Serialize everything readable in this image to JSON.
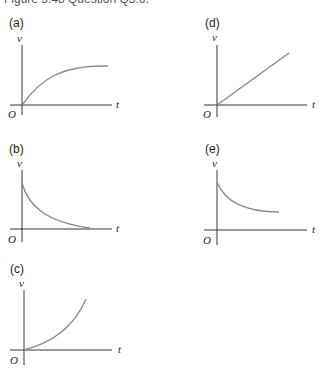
{
  "caption": "Figure 5.48  Question Q5.6.",
  "panels": [
    {
      "label": "(a)",
      "curve_type": "rising-saturating",
      "ylabel": "v",
      "xlabel": "t",
      "origin": "O"
    },
    {
      "label": "(b)",
      "curve_type": "decaying-to-zero",
      "ylabel": "v",
      "xlabel": "t",
      "origin": "O"
    },
    {
      "label": "(c)",
      "curve_type": "rising-accelerating",
      "ylabel": "v",
      "xlabel": "t",
      "origin": "O"
    },
    {
      "label": "(d)",
      "curve_type": "linear-increasing",
      "ylabel": "v",
      "xlabel": "t",
      "origin": "O"
    },
    {
      "label": "(e)",
      "curve_type": "decaying-to-constant",
      "ylabel": "v",
      "xlabel": "t",
      "origin": "O"
    }
  ],
  "colors": {
    "axis": "#231f20",
    "curve": "#8a8a8a"
  }
}
